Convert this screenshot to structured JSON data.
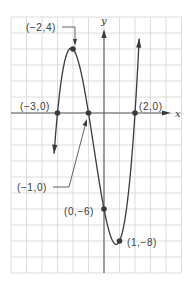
{
  "chart_data": {
    "type": "line",
    "title": "",
    "function": "f(x) = (x+3)(x+1)(x-2) = x^3 + 2x^2 - 5x - 6",
    "xlabel": "x",
    "ylabel": "y",
    "xlim": [
      -6,
      5
    ],
    "ylim": [
      -10,
      6
    ],
    "grid": true,
    "grid_step": {
      "x": 1,
      "y": 1
    },
    "legend": null,
    "series": [
      {
        "name": "f(x)",
        "x": [
          -3.22,
          -3.0,
          -2.8,
          -2.6,
          -2.4,
          -2.2,
          -2.0,
          -1.8,
          -1.6,
          -1.4,
          -1.2,
          -1.0,
          -0.8,
          -0.6,
          -0.4,
          -0.2,
          0.0,
          0.2,
          0.4,
          0.6,
          0.8,
          1.0,
          1.2,
          1.4,
          1.6,
          1.8,
          2.0,
          2.1,
          2.2,
          2.27
        ],
        "y": [
          -2.18,
          0.0,
          1.51,
          2.56,
          3.23,
          3.59,
          4.0,
          3.87,
          3.58,
          3.14,
          2.59,
          0.0,
          -1.39,
          -2.62,
          -3.6,
          -4.44,
          -6.0,
          -6.91,
          -7.62,
          -8.06,
          -8.24,
          -8.0,
          -7.56,
          -6.84,
          -5.85,
          -4.59,
          0.0,
          1.57,
          3.26,
          4.55
        ]
      }
    ],
    "points": [
      {
        "x": -3,
        "y": 0,
        "label": "(−3,0)"
      },
      {
        "x": -2,
        "y": 4,
        "label": "(−2,4)"
      },
      {
        "x": -1,
        "y": 0,
        "label": "(−1,0)"
      },
      {
        "x": 0,
        "y": -6,
        "label": "(0,−6)"
      },
      {
        "x": 1,
        "y": -8,
        "label": "(1,−8)"
      },
      {
        "x": 2,
        "y": 0,
        "label": "(2,0)"
      }
    ]
  },
  "labels": {
    "x_axis": "x",
    "y_axis": "y",
    "p_neg3_0": "(−3,0)",
    "p_neg2_4": "(−2,4)",
    "p_neg1_0": "(−1,0)",
    "p_0_neg6": "(0,−6)",
    "p_1_neg8": "(1,−8)",
    "p_2_0": "(2,0)"
  },
  "colors": {
    "grid": "#d4d4d4",
    "axis": "#5a5a5a",
    "curve": "#3a3a3a",
    "point": "#3a3a3a"
  }
}
